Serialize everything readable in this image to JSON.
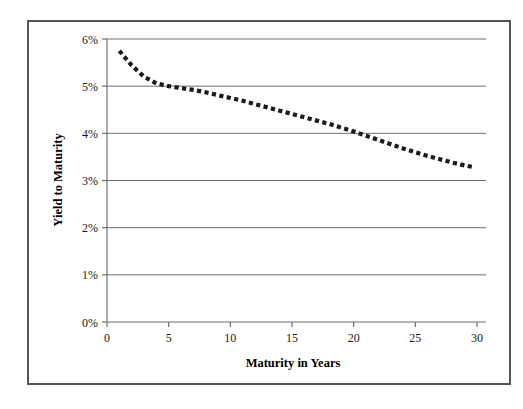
{
  "chart_data": {
    "type": "line",
    "title": "",
    "subtitle": "",
    "xlabel": "Maturity in Years",
    "ylabel": "Yield to Maturity",
    "xlim": [
      0,
      30
    ],
    "ylim": [
      0,
      6
    ],
    "xticks": [
      0,
      5,
      10,
      15,
      20,
      25,
      30
    ],
    "yticks": [
      0,
      1,
      2,
      3,
      4,
      5,
      6
    ],
    "xtick_labels": [
      "0",
      "5",
      "10",
      "15",
      "20",
      "25",
      "30"
    ],
    "ytick_labels": [
      "0%",
      "1%",
      "2%",
      "3%",
      "4%",
      "5%",
      "6%"
    ],
    "grid": "horizontal",
    "legend": "none",
    "series": [
      {
        "name": "Yield curve",
        "style": "dotted",
        "color": "#1a1a1a",
        "x": [
          1.0,
          2.0,
          3.0,
          4.0,
          5.0,
          6.0,
          7.0,
          8.0,
          9.0,
          10.0,
          11.0,
          12.0,
          13.0,
          14.0,
          15.0,
          16.0,
          17.0,
          18.0,
          19.0,
          20.0,
          21.0,
          22.0,
          23.0,
          24.0,
          25.0,
          26.0,
          27.0,
          28.0,
          29.0,
          29.8
        ],
        "y": [
          5.75,
          5.44,
          5.2,
          5.06,
          5.0,
          4.96,
          4.92,
          4.87,
          4.81,
          4.75,
          4.69,
          4.62,
          4.55,
          4.48,
          4.41,
          4.34,
          4.27,
          4.2,
          4.12,
          4.04,
          3.95,
          3.86,
          3.77,
          3.68,
          3.6,
          3.52,
          3.45,
          3.38,
          3.32,
          3.28
        ]
      }
    ]
  },
  "axis": {
    "y_title": "Yield to Maturity",
    "x_title": "Maturity in Years"
  },
  "colors": {
    "frame_border": "#555555",
    "gridline": "#6f6f6f",
    "axis_line": "#6f6f6f",
    "series": "#1a1a1a",
    "background": "#ffffff"
  }
}
